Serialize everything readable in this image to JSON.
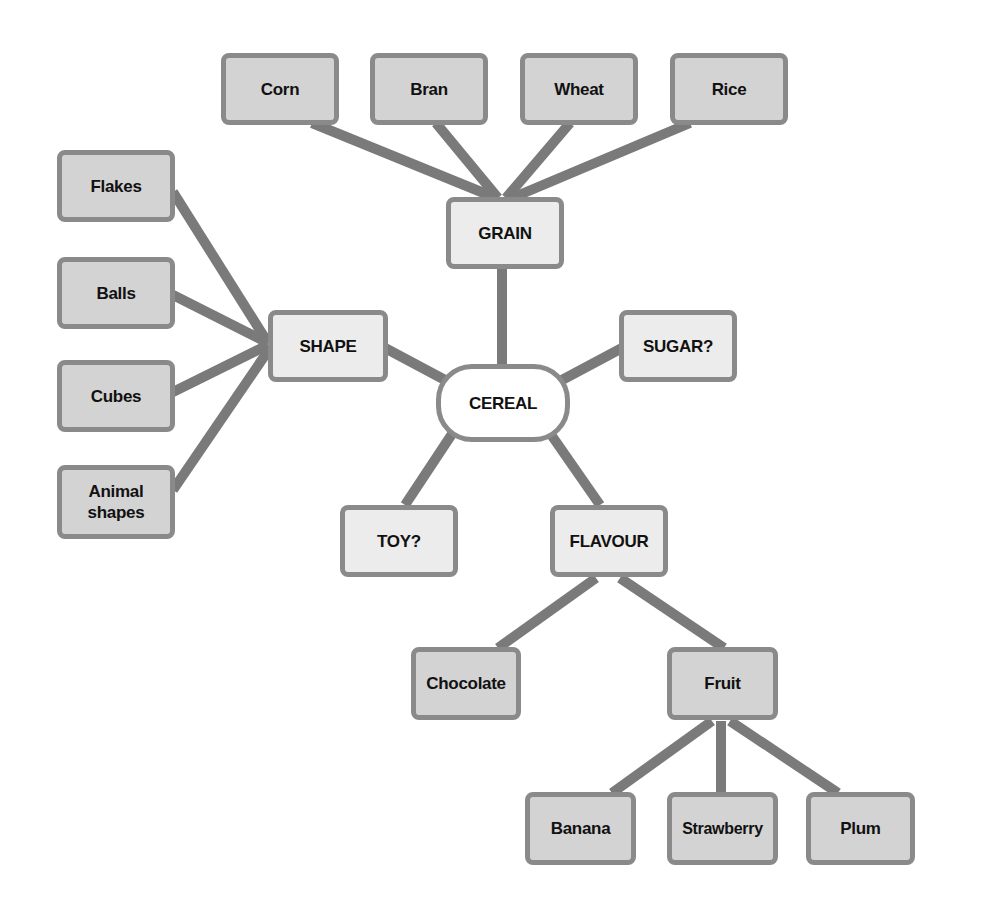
{
  "diagram": {
    "type": "mind-map",
    "root": {
      "id": "cereal",
      "label": "CEREAL"
    },
    "colors": {
      "leaf_fill": "#d3d3d3",
      "mid_fill": "#ececec",
      "root_fill": "#ffffff",
      "border": "#8a8a8a",
      "connector": "#7a7a7a"
    },
    "nodes": {
      "cereal": {
        "label": "CEREAL"
      },
      "grain": {
        "label": "GRAIN"
      },
      "shape": {
        "label": "SHAPE"
      },
      "sugar": {
        "label": "SUGAR?"
      },
      "toy": {
        "label": "TOY?"
      },
      "flavour": {
        "label": "FLAVOUR"
      },
      "corn": {
        "label": "Corn"
      },
      "bran": {
        "label": "Bran"
      },
      "wheat": {
        "label": "Wheat"
      },
      "rice": {
        "label": "Rice"
      },
      "flakes": {
        "label": "Flakes"
      },
      "balls": {
        "label": "Balls"
      },
      "cubes": {
        "label": "Cubes"
      },
      "animal": {
        "label": "Animal shapes"
      },
      "chocolate": {
        "label": "Chocolate"
      },
      "fruit": {
        "label": "Fruit"
      },
      "banana": {
        "label": "Banana"
      },
      "strawberry": {
        "label": "Strawberry"
      },
      "plum": {
        "label": "Plum"
      }
    },
    "edges": [
      [
        "cereal",
        "grain"
      ],
      [
        "cereal",
        "shape"
      ],
      [
        "cereal",
        "sugar"
      ],
      [
        "cereal",
        "toy"
      ],
      [
        "cereal",
        "flavour"
      ],
      [
        "grain",
        "corn"
      ],
      [
        "grain",
        "bran"
      ],
      [
        "grain",
        "wheat"
      ],
      [
        "grain",
        "rice"
      ],
      [
        "shape",
        "flakes"
      ],
      [
        "shape",
        "balls"
      ],
      [
        "shape",
        "cubes"
      ],
      [
        "shape",
        "animal"
      ],
      [
        "flavour",
        "chocolate"
      ],
      [
        "flavour",
        "fruit"
      ],
      [
        "fruit",
        "banana"
      ],
      [
        "fruit",
        "strawberry"
      ],
      [
        "fruit",
        "plum"
      ]
    ]
  }
}
